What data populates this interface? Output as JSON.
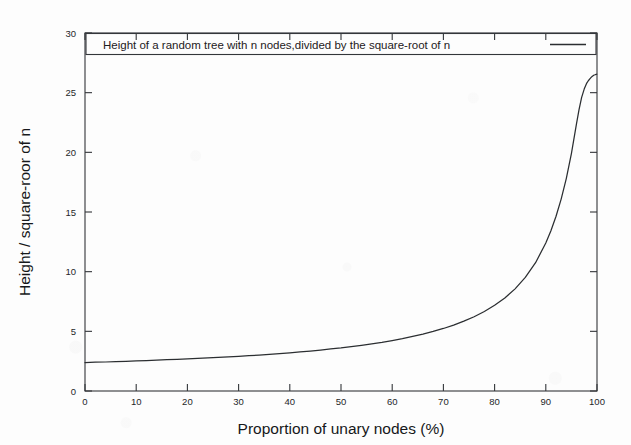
{
  "chart_data": {
    "type": "line",
    "title": "",
    "xlabel": "Proportion of unary nodes (%)",
    "ylabel": "Height / square-roor of n",
    "xlim": [
      0,
      100
    ],
    "ylim": [
      0,
      30
    ],
    "grid": false,
    "legend_position": "top",
    "legend": [
      "Height of a random tree with n nodes,divided by the square-root of n"
    ],
    "xticks": [
      "0",
      "10",
      "20",
      "30",
      "40",
      "50",
      "60",
      "70",
      "80",
      "90",
      "100"
    ],
    "xtick_values": [
      0,
      10,
      20,
      30,
      40,
      50,
      60,
      70,
      80,
      90,
      100
    ],
    "yticks": [
      "0",
      "5",
      "10",
      "15",
      "20",
      "25",
      "30"
    ],
    "ytick_values": [
      0,
      5,
      10,
      15,
      20,
      25,
      30
    ],
    "series": [
      {
        "name": "Height of a random tree with n nodes,divided by the square-root of n",
        "color": "#2b2e31",
        "x": [
          0,
          2,
          4,
          6,
          8,
          10,
          12,
          14,
          16,
          18,
          20,
          22,
          24,
          26,
          28,
          30,
          32,
          34,
          36,
          38,
          40,
          42,
          44,
          46,
          48,
          50,
          52,
          54,
          56,
          58,
          60,
          62,
          64,
          66,
          68,
          70,
          72,
          74,
          76,
          78,
          80,
          82,
          84,
          86,
          88,
          90,
          91,
          92,
          93,
          94,
          95,
          96,
          96.5,
          97,
          97.5,
          98,
          98.3,
          98.6,
          98.9,
          99.1,
          99.3,
          99.45,
          99.6,
          99.7,
          99.78,
          99.85,
          99.9,
          99.94
        ],
        "y": [
          2.38,
          2.41,
          2.43,
          2.46,
          2.49,
          2.52,
          2.55,
          2.58,
          2.62,
          2.65,
          2.69,
          2.73,
          2.77,
          2.81,
          2.86,
          2.91,
          2.96,
          3.01,
          3.07,
          3.13,
          3.2,
          3.27,
          3.35,
          3.43,
          3.52,
          3.61,
          3.72,
          3.83,
          3.95,
          4.08,
          4.23,
          4.39,
          4.57,
          4.77,
          4.99,
          5.24,
          5.52,
          5.85,
          6.22,
          6.66,
          7.18,
          7.8,
          8.56,
          9.52,
          10.75,
          12.4,
          13.43,
          14.64,
          16.08,
          17.8,
          19.9,
          22.4,
          23.6,
          24.6,
          25.3,
          25.8,
          26.0,
          26.15,
          26.3,
          26.38,
          26.44,
          26.48,
          26.5,
          26.52,
          26.53,
          26.54,
          26.54,
          26.55
        ]
      }
    ]
  },
  "geometry": {
    "plot_left": 85,
    "plot_right": 597,
    "plot_top": 33,
    "plot_bottom": 391
  }
}
